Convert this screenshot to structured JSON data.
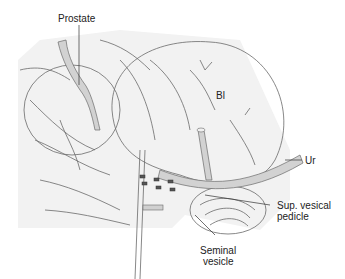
{
  "figure": {
    "type": "anatomical-illustration",
    "labels": {
      "prostate": "Prostate",
      "bladder": "Bl",
      "ureter": "Ur",
      "sup_vesical_pedicle_line1": "Sup. vesical",
      "sup_vesical_pedicle_line2": "pedicle",
      "seminal_vesicle_line1": "Seminal",
      "seminal_vesicle_line2": "vesicle"
    },
    "colors": {
      "organ_fill": "#e2e2e2",
      "vessel_fill": "#d2d2d2",
      "line": "#6a6a6a",
      "text": "#222222"
    }
  }
}
